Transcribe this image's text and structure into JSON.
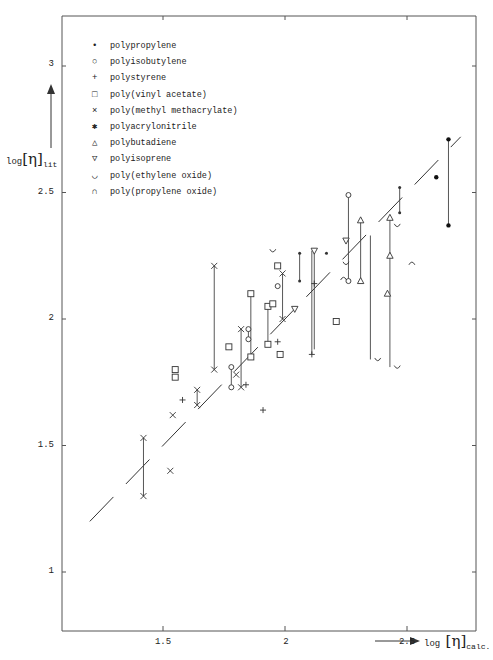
{
  "chart_data": {
    "type": "scatter",
    "title": "",
    "xlabel": "log [η]calc.",
    "ylabel": "log [η]lit",
    "xlim": [
      1.1,
      2.82
    ],
    "ylim": [
      0.82,
      3.2
    ],
    "xticks": [
      "1.5",
      "2",
      "2.5"
    ],
    "yticks": [
      "1",
      "1.5",
      "2",
      "2.5",
      "3"
    ],
    "grid": false,
    "legend_position": "upper-left",
    "reference_line": {
      "style": "dashed",
      "from": [
        1.2,
        1.2
      ],
      "to": [
        2.72,
        2.72
      ],
      "label": "log[η]lit = log[η]calc"
    },
    "series": [
      {
        "name": "polypropylene",
        "marker": "dot",
        "points": [
          [
            2.06,
            2.26
          ],
          [
            2.06,
            2.15
          ],
          [
            2.17,
            2.26
          ],
          [
            2.47,
            2.52
          ],
          [
            2.47,
            2.42
          ]
        ]
      },
      {
        "name": "polyisobutylene",
        "marker": "circle",
        "points": [
          [
            1.78,
            1.81
          ],
          [
            1.78,
            1.73
          ],
          [
            1.85,
            1.96
          ],
          [
            1.85,
            1.92
          ],
          [
            1.97,
            2.13
          ],
          [
            2.26,
            2.49
          ],
          [
            2.26,
            2.15
          ]
        ]
      },
      {
        "name": "polystyrene",
        "marker": "plus",
        "points": [
          [
            1.58,
            1.68
          ],
          [
            1.84,
            1.74
          ],
          [
            1.91,
            1.64
          ],
          [
            1.97,
            1.91
          ],
          [
            2.11,
            1.86
          ],
          [
            2.12,
            2.14
          ]
        ]
      },
      {
        "name": "poly(vinyl acetate)",
        "marker": "square",
        "points": [
          [
            1.55,
            1.8
          ],
          [
            1.55,
            1.77
          ],
          [
            1.77,
            1.89
          ],
          [
            1.86,
            2.1
          ],
          [
            1.86,
            1.85
          ],
          [
            1.93,
            1.9
          ],
          [
            1.93,
            2.05
          ],
          [
            1.95,
            2.06
          ],
          [
            1.98,
            1.86
          ],
          [
            1.97,
            2.21
          ],
          [
            2.21,
            1.99
          ]
        ]
      },
      {
        "name": "poly(methyl methacrylate)",
        "marker": "x",
        "points": [
          [
            1.42,
            1.53
          ],
          [
            1.42,
            1.3
          ],
          [
            1.53,
            1.4
          ],
          [
            1.54,
            1.62
          ],
          [
            1.64,
            1.72
          ],
          [
            1.64,
            1.66
          ],
          [
            1.71,
            2.21
          ],
          [
            1.71,
            1.8
          ],
          [
            1.8,
            1.78
          ],
          [
            1.82,
            1.96
          ],
          [
            1.82,
            1.73
          ],
          [
            1.99,
            2.18
          ],
          [
            1.99,
            2.0
          ]
        ]
      },
      {
        "name": "polyacrylonitrile",
        "marker": "filled-star",
        "points": [
          [
            2.62,
            2.56
          ],
          [
            2.67,
            2.71
          ],
          [
            2.67,
            2.37
          ]
        ]
      },
      {
        "name": "polybutadiene",
        "marker": "triangle-up",
        "points": [
          [
            2.31,
            2.39
          ],
          [
            2.31,
            2.15
          ],
          [
            2.43,
            2.4
          ],
          [
            2.43,
            2.25
          ],
          [
            2.42,
            2.1
          ]
        ]
      },
      {
        "name": "polyisoprene",
        "marker": "triangle-down",
        "points": [
          [
            2.04,
            2.04
          ],
          [
            2.12,
            2.27
          ],
          [
            2.25,
            2.31
          ]
        ]
      },
      {
        "name": "poly(ethylene oxide)",
        "marker": "cup",
        "points": [
          [
            1.95,
            2.27
          ],
          [
            2.25,
            2.22
          ],
          [
            2.38,
            1.84
          ],
          [
            2.46,
            1.81
          ],
          [
            2.46,
            2.37
          ]
        ]
      },
      {
        "name": "poly(propylene oxide)",
        "marker": "cap",
        "points": [
          [
            2.24,
            2.16
          ],
          [
            2.52,
            2.22
          ]
        ]
      }
    ],
    "error_bars": [
      {
        "x": 1.42,
        "y1": 1.53,
        "y2": 1.3
      },
      {
        "x": 1.64,
        "y1": 1.72,
        "y2": 1.66
      },
      {
        "x": 1.71,
        "y1": 2.21,
        "y2": 1.8
      },
      {
        "x": 1.78,
        "y1": 1.81,
        "y2": 1.73
      },
      {
        "x": 1.82,
        "y1": 1.96,
        "y2": 1.73
      },
      {
        "x": 1.86,
        "y1": 2.1,
        "y2": 1.85
      },
      {
        "x": 1.85,
        "y1": 1.96,
        "y2": 1.92
      },
      {
        "x": 1.93,
        "y1": 2.05,
        "y2": 1.9
      },
      {
        "x": 1.99,
        "y1": 2.18,
        "y2": 2.0
      },
      {
        "x": 2.06,
        "y1": 2.26,
        "y2": 2.15
      },
      {
        "x": 2.11,
        "y1": 2.27,
        "y2": 1.86
      },
      {
        "x": 2.12,
        "y1": 2.26,
        "y2": 1.88
      },
      {
        "x": 2.26,
        "y1": 2.49,
        "y2": 2.15
      },
      {
        "x": 2.31,
        "y1": 2.39,
        "y2": 2.15
      },
      {
        "x": 2.35,
        "y1": 2.33,
        "y2": 1.84
      },
      {
        "x": 2.43,
        "y1": 2.4,
        "y2": 1.81
      },
      {
        "x": 2.47,
        "y1": 2.52,
        "y2": 2.42
      },
      {
        "x": 2.67,
        "y1": 2.71,
        "y2": 2.37
      }
    ]
  },
  "legend": {
    "items": [
      {
        "symbol": "•",
        "label": "polypropylene"
      },
      {
        "symbol": "○",
        "label": "polyisobutylene"
      },
      {
        "symbol": "+",
        "label": "polystyrene"
      },
      {
        "symbol": "□",
        "label": "poly(vinyl acetate)"
      },
      {
        "symbol": "×",
        "label": "poly(methyl methacrylate)"
      },
      {
        "symbol": "✱",
        "label": "polyacrylonitrile"
      },
      {
        "symbol": "△",
        "label": "polybutadiene"
      },
      {
        "symbol": "▽",
        "label": "polyisoprene"
      },
      {
        "symbol": "◡",
        "label": "poly(ethylene oxide)"
      },
      {
        "symbol": "∩",
        "label": "poly(propylene oxide)"
      }
    ]
  },
  "axes": {
    "y_label_main": "log",
    "y_label_eta": "[η]",
    "y_label_sub": "lit",
    "x_label_main": "log",
    "x_label_eta": "[η]",
    "x_label_sub": "calc.",
    "yticks": [
      {
        "label": "3",
        "value": 3
      },
      {
        "label": "2.5",
        "value": 2.5
      },
      {
        "label": "2",
        "value": 2
      },
      {
        "label": "1.5",
        "value": 1.5
      },
      {
        "label": "1",
        "value": 1
      }
    ],
    "xticks": [
      {
        "label": "1.5",
        "value": 1.5
      },
      {
        "label": "2",
        "value": 2
      },
      {
        "label": "2.5",
        "value": 2.5
      }
    ]
  }
}
